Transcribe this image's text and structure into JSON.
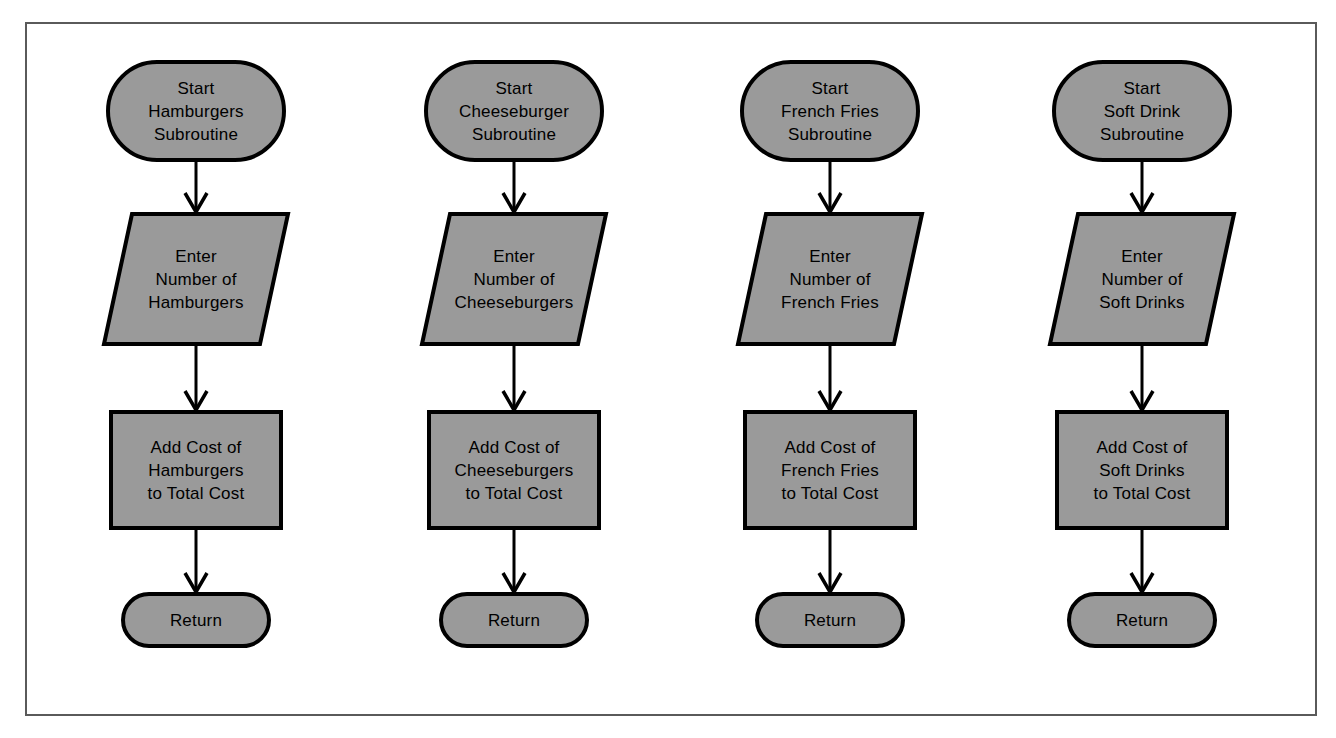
{
  "diagram": {
    "frame_border_color": "#5a5a5a",
    "node_fill_color": "#9a9a9a",
    "node_stroke_color": "#000000",
    "background_color": "#ffffff",
    "connector_color": "#000000"
  },
  "columns": [
    {
      "id": "hamburgers",
      "start": {
        "shape": "terminator",
        "lines": [
          "Start",
          "Hamburgers",
          "Subroutine"
        ]
      },
      "input": {
        "shape": "parallelogram",
        "lines": [
          "Enter",
          "Number of",
          "Hamburgers"
        ]
      },
      "process": {
        "shape": "rectangle",
        "lines": [
          "Add Cost of",
          "Hamburgers",
          "to Total Cost"
        ]
      },
      "end": {
        "shape": "terminator",
        "lines": [
          "Return"
        ]
      }
    },
    {
      "id": "cheeseburgers",
      "start": {
        "shape": "terminator",
        "lines": [
          "Start",
          "Cheeseburger",
          "Subroutine"
        ]
      },
      "input": {
        "shape": "parallelogram",
        "lines": [
          "Enter",
          "Number of",
          "Cheeseburgers"
        ]
      },
      "process": {
        "shape": "rectangle",
        "lines": [
          "Add Cost of",
          "Cheeseburgers",
          "to Total Cost"
        ]
      },
      "end": {
        "shape": "terminator",
        "lines": [
          "Return"
        ]
      }
    },
    {
      "id": "french-fries",
      "start": {
        "shape": "terminator",
        "lines": [
          "Start",
          "French Fries",
          "Subroutine"
        ]
      },
      "input": {
        "shape": "parallelogram",
        "lines": [
          "Enter",
          "Number of",
          "French Fries"
        ]
      },
      "process": {
        "shape": "rectangle",
        "lines": [
          "Add Cost of",
          "French Fries",
          "to Total Cost"
        ]
      },
      "end": {
        "shape": "terminator",
        "lines": [
          "Return"
        ]
      }
    },
    {
      "id": "soft-drinks",
      "start": {
        "shape": "terminator",
        "lines": [
          "Start",
          "Soft Drink",
          "Subroutine"
        ]
      },
      "input": {
        "shape": "parallelogram",
        "lines": [
          "Enter",
          "Number of",
          "Soft Drinks"
        ]
      },
      "process": {
        "shape": "rectangle",
        "lines": [
          "Add Cost of",
          "Soft Drinks",
          "to Total Cost"
        ]
      },
      "end": {
        "shape": "terminator",
        "lines": [
          "Return"
        ]
      }
    }
  ],
  "layout": {
    "column_centers": [
      196,
      514,
      830,
      1142
    ],
    "start": {
      "top": 62,
      "height": 98,
      "width": 176
    },
    "input": {
      "top": 214,
      "height": 130,
      "width": 156,
      "slant": 28
    },
    "process": {
      "top": 412,
      "height": 116,
      "width": 170
    },
    "end": {
      "top": 594,
      "height": 52,
      "width": 146
    }
  }
}
